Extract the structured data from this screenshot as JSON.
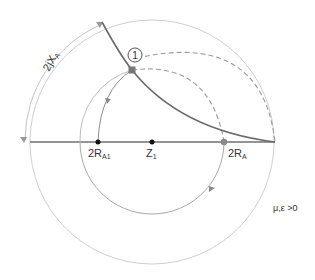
{
  "diagram": {
    "title": "",
    "colors": {
      "background": "#ffffff",
      "outer_circle": "#c8c8c8",
      "axis": "#6e6e6e",
      "dark_curve": "#6a6a6a",
      "dashed": "#9a9a9a",
      "inner_circle": "#9c9c9c",
      "point_fill": "#666666",
      "text": "#333333"
    },
    "labels": {
      "reactance_arc": "2jX",
      "reactance_sub": "A",
      "point_marker": "1",
      "r_a1_main": "2R",
      "r_a1_sub": "A1",
      "z1_main": "Z",
      "z1_sub": "1",
      "r_a_main": "2R",
      "r_a_sub": "A",
      "material_condition": "μ,ε >0"
    },
    "points": [
      {
        "id": "point-1",
        "label": "1",
        "x": 132,
        "y": 70
      },
      {
        "id": "2RA1",
        "x": 98,
        "y": 142
      },
      {
        "id": "Z1",
        "x": 152,
        "y": 142
      },
      {
        "id": "2RA",
        "x": 224,
        "y": 142
      }
    ]
  }
}
